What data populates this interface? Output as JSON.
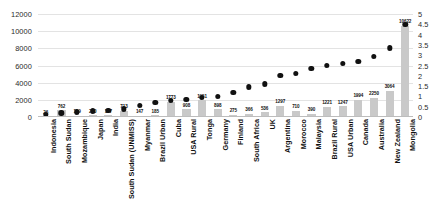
{
  "chart_data": {
    "type": "bar",
    "title": "",
    "subtitle": "",
    "xlabel": "",
    "ylabel": "",
    "grid": true,
    "legend": "none",
    "categories": [
      "Indonesia",
      "South Sudan",
      "Mozambique",
      "Japan",
      "India",
      "South Sudan (UNMISS)",
      "Myanmar",
      "Brazil Urban",
      "Cuba",
      "USA Rural",
      "Tonga",
      "Germany",
      "Finland",
      "South Africa",
      "UK",
      "Argentina",
      "Morocco",
      "Malaysia",
      "Brazil Rural",
      "USA Urban",
      "Canada",
      "Australia",
      "New Zealand",
      "Mongolia"
    ],
    "series": [
      {
        "name": "bars",
        "axis": "left",
        "type": "bar",
        "color": "#c9c9c9",
        "values": [
          26,
          762,
          119,
          210,
          187,
          713,
          147,
          185,
          1773,
          908,
          1951,
          898,
          275,
          366,
          536,
          1297,
          710,
          390,
          1221,
          1247,
          1994,
          2250,
          3064,
          10622
        ],
        "labels": [
          "26",
          "762",
          "119",
          "210",
          "187",
          "713",
          "147",
          "185",
          "1773",
          "908",
          "1951",
          "898",
          "275",
          "366",
          "536",
          "1297",
          "710",
          "390",
          "1221",
          "1247",
          "1994",
          "2250",
          "3064",
          "10622"
        ]
      },
      {
        "name": "dots",
        "axis": "right",
        "type": "scatter",
        "color": "#111111",
        "values": [
          0.12,
          0.2,
          0.25,
          0.3,
          0.33,
          0.38,
          0.55,
          0.7,
          0.8,
          0.85,
          0.95,
          1.0,
          1.2,
          1.45,
          1.6,
          2.0,
          2.1,
          2.35,
          2.5,
          2.6,
          2.7,
          2.95,
          3.35,
          4.5
        ]
      }
    ],
    "ylim": [
      0,
      12000
    ],
    "yticks": [
      0,
      2000,
      4000,
      6000,
      8000,
      10000,
      12000
    ],
    "ytick_labels": [
      "0",
      "2000",
      "4000",
      "6000",
      "8000",
      "10000",
      "12000"
    ],
    "y2lim": [
      0,
      5
    ],
    "y2ticks": [
      0,
      0.5,
      1,
      1.5,
      2,
      2.5,
      3,
      3.5,
      4,
      4.5,
      5
    ],
    "y2tick_labels": [
      "0",
      "0.5",
      "1",
      "1.5",
      "2",
      "2.5",
      "3",
      "3.5",
      "4",
      "4.5",
      "5"
    ]
  }
}
